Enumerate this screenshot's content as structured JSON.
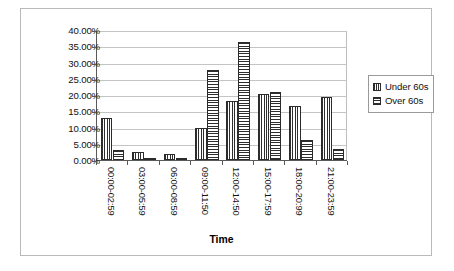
{
  "chart_data": {
    "type": "bar",
    "title": "",
    "xlabel": "Time",
    "ylabel": "",
    "ylim": [
      0,
      40
    ],
    "grid": true,
    "legend_position": "right",
    "categories": [
      "00:00-02:59",
      "03:00-05:59",
      "06:00-08:59",
      "09:00-11:50",
      "12:00-14:50",
      "15:00-17:59",
      "18:00-20:99",
      "21:00-23:59"
    ],
    "ytick_labels": [
      "40.00%",
      "35.00%",
      "30.00%",
      "25.00%",
      "20.00%",
      "15.00%",
      "10.00%",
      "5.00%",
      "0.00%"
    ],
    "ytick_values": [
      40,
      35,
      30,
      25,
      20,
      15,
      10,
      5,
      0
    ],
    "series": [
      {
        "name": "Under 60s",
        "pattern": "vertical-stripes",
        "values": [
          12.8,
          2.4,
          2.0,
          9.7,
          18.2,
          20.3,
          16.5,
          19.3
        ]
      },
      {
        "name": "Over 60s",
        "pattern": "horizontal-stripes",
        "values": [
          3.0,
          0.3,
          0.7,
          27.6,
          36.3,
          21.0,
          6.3,
          3.5
        ]
      }
    ]
  },
  "legend": {
    "items": [
      {
        "label": "Under 60s"
      },
      {
        "label": "Over 60s"
      }
    ]
  },
  "axis": {
    "x_title": "Time"
  },
  "colors": {
    "bar_outline": "#2b2b2b",
    "hatch": "#2e2e2e",
    "gridline": "#c4c4c4",
    "axis_line": "#5a5a5a",
    "frame": "#b9b9b9",
    "background": "#ffffff"
  }
}
